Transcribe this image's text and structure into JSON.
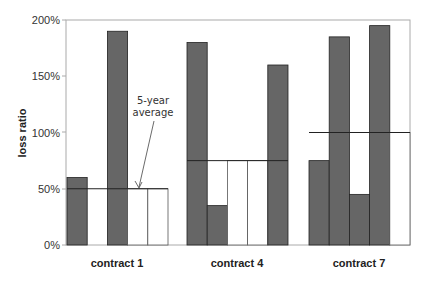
{
  "chart_data": {
    "type": "bar",
    "title": "",
    "xlabel": "",
    "ylabel": "loss ratio",
    "ylim": [
      0,
      200
    ],
    "yticks": [
      "0%",
      "50%",
      "100%",
      "150%",
      "200%"
    ],
    "categories": [
      "contract 1",
      "contract 4",
      "contract 7"
    ],
    "groups": [
      {
        "name": "contract 1",
        "average": 50,
        "bars": [
          {
            "value": 60,
            "filled": true
          },
          {
            "value": 0,
            "filled": false
          },
          {
            "value": 190,
            "filled": true
          },
          {
            "value": 50,
            "filled": false
          },
          {
            "value": 50,
            "filled": false
          }
        ]
      },
      {
        "name": "contract 4",
        "average": 75,
        "bars": [
          {
            "value": 180,
            "filled": true
          },
          {
            "value": 35,
            "filled": true
          },
          {
            "value": 75,
            "filled": false
          },
          {
            "value": 75,
            "filled": false
          },
          {
            "value": 160,
            "filled": true
          }
        ]
      },
      {
        "name": "contract 7",
        "average": 100,
        "bars": [
          {
            "value": 75,
            "filled": true
          },
          {
            "value": 185,
            "filled": true
          },
          {
            "value": 45,
            "filled": true
          },
          {
            "value": 195,
            "filled": true
          },
          {
            "value": 100,
            "filled": false
          }
        ]
      }
    ],
    "annotations": [
      {
        "text": "5-year average",
        "points_to": "contract 1 average line"
      }
    ],
    "grid": false,
    "legend": null
  },
  "labels": {
    "ylabel": "loss ratio",
    "annot_line1": "5-year",
    "annot_line2": "average",
    "x1": "contract 1",
    "x4": "contract 4",
    "x7": "contract 7",
    "t0": "0%",
    "t50": "50%",
    "t100": "100%",
    "t150": "150%",
    "t200": "200%"
  },
  "colors": {
    "bar": "#666666",
    "edge": "#222222",
    "axis": "#999999"
  }
}
